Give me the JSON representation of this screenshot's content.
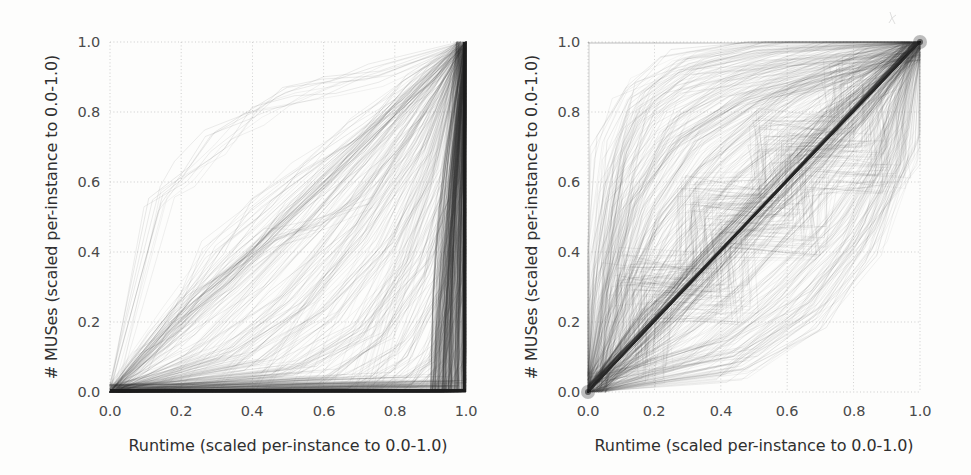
{
  "figure": {
    "background_color": "#fdfdfc",
    "ink_color": "#333333",
    "grid_color": "#b9b9b9",
    "panel_count": 2
  },
  "chart_data": [
    {
      "type": "line",
      "panel": "left",
      "title": "",
      "xlabel": "Runtime (scaled per-instance to 0.0-1.0)",
      "ylabel": "# MUSes (scaled per-instance to 0.0-1.0)",
      "xlim": [
        0.0,
        1.0
      ],
      "ylim": [
        0.0,
        1.0
      ],
      "xticks": [
        "0.0",
        "0.2",
        "0.4",
        "0.6",
        "0.8",
        "1.0"
      ],
      "yticks": [
        "0.0",
        "0.2",
        "0.4",
        "0.6",
        "0.8",
        "1.0"
      ],
      "xtick_values": [
        0.0,
        0.2,
        0.4,
        0.6,
        0.8,
        1.0
      ],
      "ytick_values": [
        0.0,
        0.2,
        0.4,
        0.6,
        0.8,
        1.0
      ],
      "grid": true,
      "grid_style": "dotted",
      "legend": "none",
      "description": "Per-instance MUS enumeration progress curves; most curves remain near 0 for nearly the whole runtime and then rise almost vertically to 1.0 at the end.",
      "series": [
        {
          "name": "curve-01",
          "x": [
            0.0,
            0.935,
            0.955,
            0.97,
            0.985,
            1.0
          ],
          "y": [
            0.0,
            0.005,
            0.1,
            0.38,
            0.74,
            1.0
          ]
        },
        {
          "name": "curve-02",
          "x": [
            0.0,
            0.945,
            0.962,
            0.976,
            0.99,
            1.0
          ],
          "y": [
            0.0,
            0.004,
            0.09,
            0.35,
            0.72,
            1.0
          ]
        },
        {
          "name": "curve-03",
          "x": [
            0.0,
            0.955,
            0.968,
            0.98,
            0.992,
            1.0
          ],
          "y": [
            0.0,
            0.004,
            0.12,
            0.42,
            0.78,
            1.0
          ]
        },
        {
          "name": "curve-04",
          "x": [
            0.0,
            0.962,
            0.974,
            0.984,
            0.994,
            1.0
          ],
          "y": [
            0.0,
            0.003,
            0.1,
            0.4,
            0.76,
            1.0
          ]
        },
        {
          "name": "curve-05",
          "x": [
            0.0,
            0.97,
            0.98,
            0.988,
            0.995,
            1.0
          ],
          "y": [
            0.0,
            0.003,
            0.11,
            0.41,
            0.77,
            1.0
          ]
        },
        {
          "name": "curve-06",
          "x": [
            0.0,
            0.976,
            0.984,
            0.991,
            0.997,
            1.0
          ],
          "y": [
            0.0,
            0.002,
            0.12,
            0.44,
            0.8,
            1.0
          ]
        },
        {
          "name": "curve-07",
          "x": [
            0.0,
            0.982,
            0.988,
            0.994,
            0.998,
            1.0
          ],
          "y": [
            0.0,
            0.002,
            0.13,
            0.46,
            0.82,
            1.0
          ]
        },
        {
          "name": "curve-08",
          "x": [
            0.0,
            0.988,
            0.993,
            0.996,
            0.999,
            1.0
          ],
          "y": [
            0.0,
            0.002,
            0.14,
            0.48,
            0.84,
            1.0
          ]
        },
        {
          "name": "curve-09",
          "x": [
            0.0,
            0.993,
            0.996,
            0.998,
            0.999,
            1.0
          ],
          "y": [
            0.0,
            0.001,
            0.16,
            0.52,
            0.86,
            1.0
          ]
        },
        {
          "name": "curve-10",
          "x": [
            0.0,
            0.996,
            0.998,
            0.999,
            1.0
          ],
          "y": [
            0.0,
            0.001,
            0.25,
            0.65,
            1.0
          ]
        },
        {
          "name": "curve-11",
          "x": [
            0.0,
            0.2,
            0.4,
            0.6,
            0.8,
            0.92,
            1.0
          ],
          "y": [
            0.0,
            0.2,
            0.4,
            0.6,
            0.8,
            0.92,
            1.0
          ]
        },
        {
          "name": "curve-12",
          "x": [
            0.0,
            0.15,
            0.32,
            0.5,
            0.7,
            0.88,
            1.0
          ],
          "y": [
            0.0,
            0.17,
            0.35,
            0.53,
            0.72,
            0.9,
            1.0
          ]
        },
        {
          "name": "curve-13",
          "x": [
            0.0,
            0.12,
            0.25,
            0.4,
            0.6,
            0.82,
            1.0
          ],
          "y": [
            0.0,
            0.13,
            0.27,
            0.42,
            0.62,
            0.83,
            1.0
          ]
        },
        {
          "name": "curve-14",
          "x": [
            0.0,
            0.18,
            0.35,
            0.55,
            0.75,
            0.9,
            1.0
          ],
          "y": [
            0.0,
            0.14,
            0.3,
            0.5,
            0.72,
            0.89,
            1.0
          ]
        },
        {
          "name": "curve-15",
          "x": [
            0.0,
            0.25,
            0.45,
            0.65,
            0.85,
            1.0
          ],
          "y": [
            0.0,
            0.12,
            0.3,
            0.52,
            0.78,
            1.0
          ]
        },
        {
          "name": "curve-16",
          "x": [
            0.0,
            0.3,
            0.5,
            0.68,
            0.85,
            1.0
          ],
          "y": [
            0.0,
            0.1,
            0.26,
            0.46,
            0.72,
            1.0
          ]
        },
        {
          "name": "curve-17",
          "x": [
            0.0,
            0.35,
            0.55,
            0.72,
            0.88,
            1.0
          ],
          "y": [
            0.0,
            0.09,
            0.24,
            0.44,
            0.7,
            1.0
          ]
        },
        {
          "name": "curve-18",
          "x": [
            0.0,
            0.4,
            0.6,
            0.78,
            0.9,
            1.0
          ],
          "y": [
            0.0,
            0.08,
            0.22,
            0.42,
            0.66,
            1.0
          ]
        },
        {
          "name": "curve-19",
          "x": [
            0.0,
            0.45,
            0.65,
            0.8,
            0.92,
            1.0
          ],
          "y": [
            0.0,
            0.07,
            0.2,
            0.4,
            0.64,
            1.0
          ]
        },
        {
          "name": "curve-20",
          "x": [
            0.0,
            0.5,
            0.7,
            0.85,
            0.94,
            1.0
          ],
          "y": [
            0.0,
            0.06,
            0.18,
            0.38,
            0.62,
            1.0
          ]
        },
        {
          "name": "curve-21",
          "x": [
            0.0,
            0.14,
            0.22,
            0.3,
            0.42,
            0.5,
            0.62,
            0.76,
            1.0
          ],
          "y": [
            0.0,
            0.55,
            0.62,
            0.72,
            0.8,
            0.84,
            0.88,
            0.9,
            1.0
          ]
        },
        {
          "name": "curve-22",
          "x": [
            0.0,
            0.18,
            0.3,
            0.42,
            0.55,
            0.7,
            0.85,
            1.0
          ],
          "y": [
            0.0,
            0.22,
            0.4,
            0.52,
            0.62,
            0.74,
            0.86,
            1.0
          ]
        },
        {
          "name": "curve-23",
          "x": [
            0.0,
            0.55,
            0.72,
            0.86,
            0.95,
            1.0
          ],
          "y": [
            0.0,
            0.05,
            0.17,
            0.36,
            0.6,
            1.0
          ]
        },
        {
          "name": "curve-24",
          "x": [
            0.0,
            0.62,
            0.78,
            0.9,
            0.97,
            1.0
          ],
          "y": [
            0.0,
            0.04,
            0.15,
            0.34,
            0.58,
            1.0
          ]
        },
        {
          "name": "curve-25",
          "x": [
            0.0,
            0.7,
            0.84,
            0.93,
            0.98,
            1.0
          ],
          "y": [
            0.0,
            0.03,
            0.13,
            0.32,
            0.56,
            1.0
          ]
        },
        {
          "name": "curve-26",
          "x": [
            0.0,
            0.78,
            0.88,
            0.95,
            0.99,
            1.0
          ],
          "y": [
            0.0,
            0.02,
            0.11,
            0.3,
            0.54,
            1.0
          ]
        },
        {
          "name": "curve-27",
          "x": [
            0.0,
            0.84,
            0.92,
            0.97,
            0.99,
            1.0
          ],
          "y": [
            0.0,
            0.02,
            0.1,
            0.28,
            0.52,
            1.0
          ]
        },
        {
          "name": "curve-28",
          "x": [
            0.0,
            0.88,
            0.94,
            0.98,
            1.0
          ],
          "y": [
            0.0,
            0.01,
            0.09,
            0.3,
            1.0
          ]
        },
        {
          "name": "curve-29",
          "x": [
            0.0,
            0.24,
            0.46,
            0.58,
            0.7,
            0.82,
            0.92,
            1.0
          ],
          "y": [
            0.0,
            0.28,
            0.44,
            0.48,
            0.56,
            0.7,
            0.84,
            1.0
          ]
        },
        {
          "name": "curve-30",
          "x": [
            0.0,
            0.1,
            0.2,
            0.34,
            0.52,
            0.7,
            0.86,
            1.0
          ],
          "y": [
            0.0,
            0.09,
            0.19,
            0.33,
            0.5,
            0.68,
            0.85,
            1.0
          ]
        }
      ]
    },
    {
      "type": "line",
      "panel": "right",
      "title": "",
      "xlabel": "Runtime (scaled per-instance to 0.0-1.0)",
      "ylabel": "# MUSes (scaled per-instance to 0.0-1.0)",
      "xlim": [
        0.0,
        1.0
      ],
      "ylim": [
        0.0,
        1.0
      ],
      "xticks": [
        "0.0",
        "0.2",
        "0.4",
        "0.6",
        "0.8",
        "1.0"
      ],
      "yticks": [
        "0.0",
        "0.2",
        "0.4",
        "0.6",
        "0.8",
        "1.0"
      ],
      "xtick_values": [
        0.0,
        0.2,
        0.4,
        0.6,
        0.8,
        1.0
      ],
      "ytick_values": [
        0.0,
        0.2,
        0.4,
        0.6,
        0.8,
        1.0
      ],
      "grid": true,
      "grid_style": "dotted",
      "legend": "none",
      "description": "Per-instance MUS enumeration progress curves clustered densely along the y=x diagonal, with a lighter cloud of faster (above-diagonal) curves that saturate early near 1.0.",
      "series": [
        {
          "name": "diagonal-band",
          "x": [
            0.0,
            0.2,
            0.4,
            0.6,
            0.8,
            1.0
          ],
          "y": [
            0.0,
            0.2,
            0.4,
            0.6,
            0.8,
            1.0
          ]
        },
        {
          "name": "fast-01",
          "x": [
            0.0,
            0.05,
            0.12,
            0.25,
            0.45,
            0.7,
            1.0
          ],
          "y": [
            0.0,
            0.3,
            0.58,
            0.76,
            0.88,
            0.95,
            1.0
          ]
        },
        {
          "name": "fast-02",
          "x": [
            0.0,
            0.08,
            0.18,
            0.32,
            0.55,
            0.8,
            1.0
          ],
          "y": [
            0.0,
            0.26,
            0.52,
            0.72,
            0.86,
            0.94,
            1.0
          ]
        },
        {
          "name": "fast-03",
          "x": [
            0.0,
            0.1,
            0.22,
            0.38,
            0.6,
            0.84,
            1.0
          ],
          "y": [
            0.0,
            0.22,
            0.46,
            0.66,
            0.82,
            0.93,
            1.0
          ]
        },
        {
          "name": "fast-04",
          "x": [
            0.0,
            0.12,
            0.26,
            0.44,
            0.66,
            0.88,
            1.0
          ],
          "y": [
            0.0,
            0.2,
            0.42,
            0.62,
            0.8,
            0.92,
            1.0
          ]
        },
        {
          "name": "fast-05",
          "x": [
            0.0,
            0.15,
            0.3,
            0.5,
            0.72,
            0.9,
            1.0
          ],
          "y": [
            0.0,
            0.18,
            0.38,
            0.58,
            0.78,
            0.91,
            1.0
          ]
        },
        {
          "name": "fast-06",
          "x": [
            0.0,
            0.04,
            0.09,
            0.16,
            0.3,
            0.55,
            1.0
          ],
          "y": [
            0.0,
            0.34,
            0.62,
            0.8,
            0.9,
            0.96,
            1.0
          ]
        },
        {
          "name": "fast-07",
          "x": [
            0.0,
            0.03,
            0.07,
            0.14,
            0.28,
            0.52,
            1.0
          ],
          "y": [
            0.0,
            0.38,
            0.66,
            0.83,
            0.92,
            0.97,
            1.0
          ]
        },
        {
          "name": "fast-08",
          "x": [
            0.0,
            0.06,
            0.14,
            0.28,
            0.5,
            0.76,
            1.0
          ],
          "y": [
            0.0,
            0.28,
            0.54,
            0.74,
            0.87,
            0.95,
            1.0
          ]
        },
        {
          "name": "step-01",
          "x": [
            0.0,
            0.1,
            0.1,
            0.3,
            0.3,
            0.52,
            0.52,
            0.75,
            0.75,
            1.0
          ],
          "y": [
            0.0,
            0.12,
            0.34,
            0.34,
            0.56,
            0.56,
            0.74,
            0.74,
            0.9,
            1.0
          ]
        },
        {
          "name": "step-02",
          "x": [
            0.0,
            0.14,
            0.14,
            0.36,
            0.36,
            0.6,
            0.6,
            0.84,
            0.84,
            1.0
          ],
          "y": [
            0.0,
            0.1,
            0.3,
            0.3,
            0.5,
            0.5,
            0.68,
            0.68,
            0.86,
            1.0
          ]
        },
        {
          "name": "step-03",
          "x": [
            0.0,
            0.2,
            0.2,
            0.44,
            0.44,
            0.68,
            0.68,
            0.9,
            0.9,
            1.0
          ],
          "y": [
            0.0,
            0.08,
            0.26,
            0.26,
            0.44,
            0.44,
            0.62,
            0.62,
            0.82,
            1.0
          ]
        },
        {
          "name": "slow-01",
          "x": [
            0.0,
            0.25,
            0.45,
            0.65,
            0.85,
            1.0
          ],
          "y": [
            0.0,
            0.14,
            0.3,
            0.5,
            0.74,
            1.0
          ]
        },
        {
          "name": "slow-02",
          "x": [
            0.0,
            0.32,
            0.54,
            0.74,
            0.9,
            1.0
          ],
          "y": [
            0.0,
            0.12,
            0.28,
            0.48,
            0.72,
            1.0
          ]
        },
        {
          "name": "slow-03",
          "x": [
            0.0,
            0.4,
            0.62,
            0.8,
            0.93,
            1.0
          ],
          "y": [
            0.0,
            0.1,
            0.26,
            0.46,
            0.7,
            1.0
          ]
        },
        {
          "name": "slow-04",
          "x": [
            0.0,
            0.48,
            0.7,
            0.86,
            0.96,
            1.0
          ],
          "y": [
            0.0,
            0.08,
            0.22,
            0.42,
            0.68,
            1.0
          ]
        }
      ]
    }
  ],
  "panels": [
    {
      "id": "left",
      "xlabel": "Runtime (scaled per-instance to 0.0-1.0)",
      "ylabel": "# MUSes (scaled per-instance to 0.0-1.0)",
      "xticks": [
        "0.0",
        "0.2",
        "0.4",
        "0.6",
        "0.8",
        "1.0"
      ],
      "yticks": [
        "0.0",
        "0.2",
        "0.4",
        "0.6",
        "0.8",
        "1.0"
      ]
    },
    {
      "id": "right",
      "xlabel": "Runtime (scaled per-instance to 0.0-1.0)",
      "ylabel": "# MUSes (scaled per-instance to 0.0-1.0)",
      "xticks": [
        "0.0",
        "0.2",
        "0.4",
        "0.6",
        "0.8",
        "1.0"
      ],
      "yticks": [
        "0.0",
        "0.2",
        "0.4",
        "0.6",
        "0.8",
        "1.0"
      ]
    }
  ]
}
